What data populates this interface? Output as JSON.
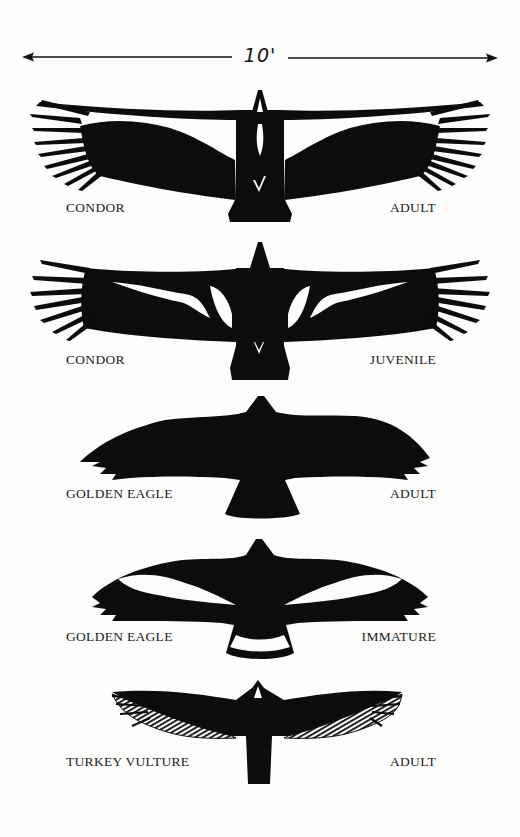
{
  "scale": {
    "label": "10'",
    "meaning": "wingspan scale bar"
  },
  "birds": [
    {
      "species": "CONDOR",
      "age": "ADULT"
    },
    {
      "species": "CONDOR",
      "age": "JUVENILE"
    },
    {
      "species": "GOLDEN EAGLE",
      "age": "ADULT"
    },
    {
      "species": "GOLDEN EAGLE",
      "age": "IMMATURE"
    },
    {
      "species": "TURKEY VULTURE",
      "age": "ADULT"
    }
  ],
  "colors": {
    "background": "#fdfdfb",
    "silhouette": "#0c0c0c",
    "marking": "#ffffff"
  }
}
